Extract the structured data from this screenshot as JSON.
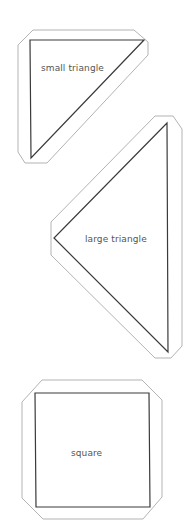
{
  "colors": {
    "background": "#ffffff",
    "cut_outline": "#b3b3b3",
    "shape_stroke": "#3a3a3a",
    "label_text": "#555555"
  },
  "pieces": [
    {
      "id": "small-triangle",
      "label": "small triangle",
      "shape": "triangle",
      "vertices": [
        [
          30,
          40
        ],
        [
          144,
          40
        ],
        [
          31,
          158
        ]
      ],
      "outline": [
        [
          33,
          30
        ],
        [
          134,
          30
        ],
        [
          148,
          42
        ],
        [
          148,
          55
        ],
        [
          47,
          163
        ],
        [
          25,
          163
        ],
        [
          18,
          152
        ],
        [
          18,
          45
        ]
      ],
      "label_pos": [
        41,
        63
      ]
    },
    {
      "id": "large-triangle",
      "label": "large triangle",
      "shape": "triangle",
      "vertices": [
        [
          167,
          123
        ],
        [
          168,
          352
        ],
        [
          54,
          238
        ]
      ],
      "outline": [
        [
          155,
          116
        ],
        [
          173,
          116
        ],
        [
          182,
          129
        ],
        [
          182,
          346
        ],
        [
          171,
          358
        ],
        [
          155,
          358
        ],
        [
          51,
          255
        ],
        [
          51,
          222
        ]
      ],
      "label_pos": [
        85,
        234
      ]
    },
    {
      "id": "square",
      "label": "square",
      "shape": "square",
      "vertices": [
        [
          35,
          393
        ],
        [
          149,
          393
        ],
        [
          150,
          507
        ],
        [
          36,
          507
        ]
      ],
      "outline": [
        [
          42,
          380
        ],
        [
          142,
          380
        ],
        [
          162,
          400
        ],
        [
          162,
          497
        ],
        [
          143,
          519
        ],
        [
          43,
          519
        ],
        [
          22,
          498
        ],
        [
          22,
          402
        ]
      ],
      "label_pos": [
        71,
        448
      ]
    }
  ]
}
